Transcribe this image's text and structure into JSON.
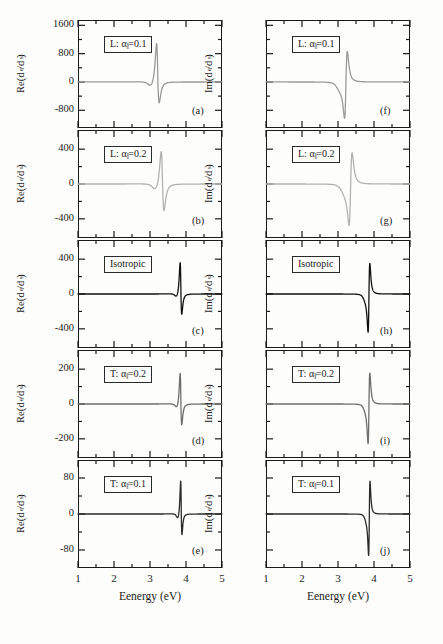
{
  "figure": {
    "columns": [
      {
        "id": "left",
        "ylabel_prefix": "Re(d",
        "ylabel_sub1": "e",
        "ylabel_mid": "/d",
        "ylabel_sub2": "s",
        "ylabel_suffix": ")",
        "xtitle": "Eenergy (eV)",
        "show_ynumbers": true
      },
      {
        "id": "right",
        "ylabel_prefix": "Im(d",
        "ylabel_sub1": "e",
        "ylabel_mid": "/d",
        "ylabel_sub2": "s",
        "ylabel_suffix": ")",
        "xtitle": "Eenergy (eV)",
        "show_ynumbers": false
      }
    ],
    "xaxis": {
      "min": 1,
      "max": 5,
      "ticks": [
        1,
        2,
        3,
        4,
        5
      ],
      "minor_per_major": 2,
      "label": "Eenergy (eV)"
    },
    "panels": [
      {
        "key": "a",
        "plabel": "(a)",
        "tag_prefix": "L: ",
        "tag_sym": "α",
        "tag_par": "‖",
        "tag_value": "=0.1",
        "yticks": [
          "1600",
          "800",
          "0",
          "-800"
        ],
        "ymin": -1300,
        "ymax": 1750,
        "color": "#9a9a9a",
        "linewidth": 1.3
      },
      {
        "key": "b",
        "plabel": "(b)",
        "tag_prefix": "L: ",
        "tag_sym": "α",
        "tag_par": "‖",
        "tag_value": "=0.2",
        "yticks": [
          "400",
          "0",
          "-400"
        ],
        "ymin": -620,
        "ymax": 620,
        "color": "#b2b2b2",
        "linewidth": 1.3
      },
      {
        "key": "c",
        "plabel": "(c)",
        "tag_prefix": "Isotropic",
        "tag_sym": "",
        "tag_par": "",
        "tag_value": "",
        "yticks": [
          "400",
          "0",
          "-400"
        ],
        "ymin": -620,
        "ymax": 620,
        "color": "#111111",
        "linewidth": 1.3
      },
      {
        "key": "d",
        "plabel": "(d)",
        "tag_prefix": "T: ",
        "tag_sym": "α",
        "tag_par": "‖",
        "tag_value": "=0.2",
        "yticks": [
          "200",
          "0",
          "-200"
        ],
        "ymin": -310,
        "ymax": 310,
        "color": "#6e6e6e",
        "linewidth": 1.3
      },
      {
        "key": "e",
        "plabel": "(e)",
        "tag_prefix": "T: ",
        "tag_sym": "α",
        "tag_par": "‖",
        "tag_value": "=0.1",
        "yticks": [
          "80",
          "0",
          "-80"
        ],
        "ymin": -120,
        "ymax": 120,
        "color": "#2b2b2b",
        "linewidth": 1.3
      },
      {
        "key": "f",
        "plabel": "(f)",
        "tag_prefix": "L: ",
        "tag_sym": "α",
        "tag_par": "‖",
        "tag_value": "=0.1",
        "yticks": [],
        "ymin": -1300,
        "ymax": 1750,
        "color": "#9a9a9a",
        "linewidth": 1.3
      },
      {
        "key": "g",
        "plabel": "(g)",
        "tag_prefix": "L: ",
        "tag_sym": "α",
        "tag_par": "‖",
        "tag_value": "=0.2",
        "yticks": [],
        "ymin": -620,
        "ymax": 620,
        "color": "#b2b2b2",
        "linewidth": 1.3
      },
      {
        "key": "h",
        "plabel": "(h)",
        "tag_prefix": "Isotropic",
        "tag_sym": "",
        "tag_par": "",
        "tag_value": "",
        "yticks": [],
        "ymin": -620,
        "ymax": 620,
        "color": "#111111",
        "linewidth": 1.3
      },
      {
        "key": "i",
        "plabel": "(i)",
        "tag_prefix": "T: ",
        "tag_sym": "α",
        "tag_par": "‖",
        "tag_value": "=0.2",
        "yticks": [],
        "ymin": -310,
        "ymax": 310,
        "color": "#6e6e6e",
        "linewidth": 1.3
      },
      {
        "key": "j",
        "plabel": "(j)",
        "tag_prefix": "T: ",
        "tag_sym": "α",
        "tag_par": "‖",
        "tag_value": "=0.1",
        "yticks": [],
        "ymin": -120,
        "ymax": 120,
        "color": "#2b2b2b",
        "linewidth": 1.3
      }
    ]
  },
  "chart_data": {
    "type": "line",
    "title": "",
    "xlabel": "Eenergy (eV)",
    "xlim": [
      1,
      5
    ],
    "grid": false,
    "legend": "none",
    "panels": [
      {
        "key": "a",
        "ylabel": "Re(d_e/d_s)",
        "annotation": "L: α‖=0.1",
        "ylim": [
          -1300,
          1750
        ],
        "yticks": [
          1600,
          800,
          0,
          -800
        ],
        "resonance_eV": 3.22,
        "width_eV": 0.055,
        "shape": "dispersive-real",
        "peak_positive": 1560,
        "peak_negative": -760,
        "dip_before_eV": 3.05,
        "dip_before_value": -190,
        "baseline": 0
      },
      {
        "key": "b",
        "ylabel": "Re(d_e/d_s)",
        "annotation": "L: α‖=0.2",
        "ylim": [
          -620,
          620
        ],
        "yticks": [
          400,
          0,
          -400
        ],
        "resonance_eV": 3.35,
        "width_eV": 0.06,
        "shape": "dispersive-real",
        "peak_positive": 560,
        "peak_negative": -390,
        "dip_before_eV": 3.18,
        "dip_before_value": -95,
        "baseline": 0
      },
      {
        "key": "c",
        "ylabel": "Re(d_e/d_s)",
        "annotation": "Isotropic",
        "ylim": [
          -620,
          620
        ],
        "yticks": [
          400,
          0,
          -400
        ],
        "resonance_eV": 3.86,
        "width_eV": 0.035,
        "shape": "dispersive-real",
        "peak_positive": 520,
        "peak_negative": -300,
        "dip_before_eV": 3.76,
        "dip_before_value": -60,
        "baseline": 0
      },
      {
        "key": "d",
        "ylabel": "Re(d_e/d_s)",
        "annotation": "T: α‖=0.2",
        "ylim": [
          -310,
          310
        ],
        "yticks": [
          200,
          0,
          -200
        ],
        "resonance_eV": 3.86,
        "width_eV": 0.035,
        "shape": "dispersive-real",
        "peak_positive": 265,
        "peak_negative": -150,
        "dip_before_eV": 3.77,
        "dip_before_value": -38,
        "baseline": 0
      },
      {
        "key": "e",
        "ylabel": "Re(d_e/d_s)",
        "annotation": "T: α‖=0.1",
        "ylim": [
          -120,
          120
        ],
        "yticks": [
          80,
          0,
          -80
        ],
        "resonance_eV": 3.87,
        "width_eV": 0.028,
        "shape": "dispersive-real",
        "peak_positive": 108,
        "peak_negative": -58,
        "dip_before_eV": 3.79,
        "dip_before_value": -16,
        "baseline": 0
      },
      {
        "key": "f",
        "ylabel": "Im(d_e/d_s)",
        "annotation": "L: α‖=0.1",
        "ylim": [
          -1300,
          1750
        ],
        "yticks": [],
        "resonance_eV": 3.22,
        "width_eV": 0.055,
        "shape": "dispersive-imag",
        "peak_positive": 1180,
        "peak_negative": -1250,
        "dip_before_eV": 3.06,
        "dip_before_value": -180,
        "baseline": 0
      },
      {
        "key": "g",
        "ylabel": "Im(d_e/d_s)",
        "annotation": "L: α‖=0.2",
        "ylim": [
          -620,
          620
        ],
        "yticks": [],
        "resonance_eV": 3.35,
        "width_eV": 0.06,
        "shape": "dispersive-imag",
        "peak_positive": 500,
        "peak_negative": -560,
        "dip_before_eV": 3.2,
        "dip_before_value": -90,
        "baseline": 0
      },
      {
        "key": "h",
        "ylabel": "Im(d_e/d_s)",
        "annotation": "Isotropic",
        "ylim": [
          -620,
          620
        ],
        "yticks": [],
        "resonance_eV": 3.86,
        "width_eV": 0.035,
        "shape": "dispersive-imag",
        "peak_positive": 480,
        "peak_negative": -540,
        "dip_before_eV": 3.77,
        "dip_before_value": -55,
        "baseline": 0
      },
      {
        "key": "i",
        "ylabel": "Im(d_e/d_s)",
        "annotation": "T: α‖=0.2",
        "ylim": [
          -310,
          310
        ],
        "yticks": [],
        "resonance_eV": 3.86,
        "width_eV": 0.035,
        "shape": "dispersive-imag",
        "peak_positive": 245,
        "peak_negative": -275,
        "dip_before_eV": 3.78,
        "dip_before_value": -30,
        "baseline": 0
      },
      {
        "key": "j",
        "ylabel": "Im(d_e/d_s)",
        "annotation": "T: α‖=0.1",
        "ylim": [
          -120,
          120
        ],
        "yticks": [],
        "resonance_eV": 3.87,
        "width_eV": 0.028,
        "shape": "dispersive-imag",
        "peak_positive": 100,
        "peak_negative": -112,
        "dip_before_eV": 3.8,
        "dip_before_value": -13,
        "baseline": 0
      }
    ]
  }
}
